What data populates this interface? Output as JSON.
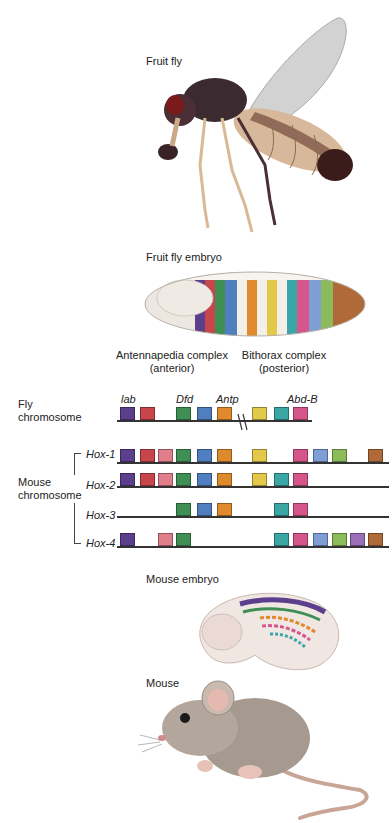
{
  "labels": {
    "fruit_fly": "Fruit fly",
    "fruit_fly_embryo": "Fruit fly embryo",
    "antennapedia_title": "Antennapedia complex",
    "antennapedia_sub": "(anterior)",
    "bithorax_title": "Bithorax complex",
    "bithorax_sub": "(posterior)",
    "fly_chromosome_1": "Fly",
    "fly_chromosome_2": "chromosome",
    "mouse_chromosome_1": "Mouse",
    "mouse_chromosome_2": "chromosome",
    "mouse_embryo": "Mouse embryo",
    "mouse": "Mouse"
  },
  "fly_genes": {
    "lab": "lab",
    "dfd": "Dfd",
    "antp": "Antp",
    "abdb": "Abd-B"
  },
  "colors": {
    "c1": "#5b3f8c",
    "c2": "#c8454b",
    "c3": "#e07e8a",
    "c4": "#3f8f55",
    "c5": "#4f7fbf",
    "c6": "#e08a2e",
    "c7": "#3aa6a6",
    "c8": "#e3c94a",
    "c9": "#d6568c",
    "c10": "#7f9ed6",
    "c11": "#8bbb5a",
    "c12": "#b06a3a",
    "c13": "#9a6fb8"
  },
  "mouse_clusters": [
    {
      "name": "Hox-1"
    },
    {
      "name": "Hox-2"
    },
    {
      "name": "Hox-3"
    },
    {
      "name": "Hox-4"
    }
  ]
}
